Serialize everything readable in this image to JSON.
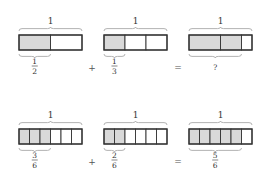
{
  "colors": {
    "shaded": "#d9d9d9",
    "unshaded": "#ffffff",
    "stroke": "#333333",
    "brace": "#aaaaaa"
  },
  "rows": [
    {
      "operator_plus": "+",
      "operator_equals": "=",
      "bars": [
        {
          "whole_label": "1",
          "segments": [
            {
              "size": 0.5,
              "shaded": true
            },
            {
              "size": 0.5,
              "shaded": false
            }
          ],
          "brace_fraction": 0.5,
          "label": {
            "numerator": "1",
            "denominator": "2",
            "text": ""
          }
        },
        {
          "whole_label": "1",
          "segments": [
            {
              "size": 0.3333,
              "shaded": true
            },
            {
              "size": 0.3333,
              "shaded": false
            },
            {
              "size": 0.3334,
              "shaded": false
            }
          ],
          "brace_fraction": 0.3333,
          "label": {
            "numerator": "1",
            "denominator": "3",
            "text": ""
          }
        },
        {
          "whole_label": "1",
          "segments": [
            {
              "size": 0.5,
              "shaded": true
            },
            {
              "size": 0.3333,
              "shaded": true
            },
            {
              "size": 0.1667,
              "shaded": false
            }
          ],
          "brace_fraction": 0.8333,
          "label": {
            "numerator": "",
            "denominator": "",
            "text": "?"
          }
        }
      ]
    },
    {
      "operator_plus": "+",
      "operator_equals": "=",
      "bars": [
        {
          "whole_label": "1",
          "segments": [
            {
              "size": 0.1667,
              "shaded": true
            },
            {
              "size": 0.1667,
              "shaded": true
            },
            {
              "size": 0.1667,
              "shaded": true
            },
            {
              "size": 0.1667,
              "shaded": false
            },
            {
              "size": 0.1667,
              "shaded": false
            },
            {
              "size": 0.1665,
              "shaded": false
            }
          ],
          "brace_fraction": 0.5,
          "label": {
            "numerator": "3",
            "denominator": "6",
            "text": ""
          }
        },
        {
          "whole_label": "1",
          "segments": [
            {
              "size": 0.1667,
              "shaded": true
            },
            {
              "size": 0.1667,
              "shaded": true
            },
            {
              "size": 0.1667,
              "shaded": false
            },
            {
              "size": 0.1667,
              "shaded": false
            },
            {
              "size": 0.1667,
              "shaded": false
            },
            {
              "size": 0.1665,
              "shaded": false
            }
          ],
          "brace_fraction": 0.3333,
          "label": {
            "numerator": "2",
            "denominator": "6",
            "text": ""
          }
        },
        {
          "whole_label": "1",
          "segments": [
            {
              "size": 0.1667,
              "shaded": true
            },
            {
              "size": 0.1667,
              "shaded": true
            },
            {
              "size": 0.1667,
              "shaded": true
            },
            {
              "size": 0.1667,
              "shaded": true
            },
            {
              "size": 0.1667,
              "shaded": true
            },
            {
              "size": 0.1665,
              "shaded": false
            }
          ],
          "brace_fraction": 0.8333,
          "label": {
            "numerator": "5",
            "denominator": "6",
            "text": ""
          }
        }
      ]
    }
  ]
}
